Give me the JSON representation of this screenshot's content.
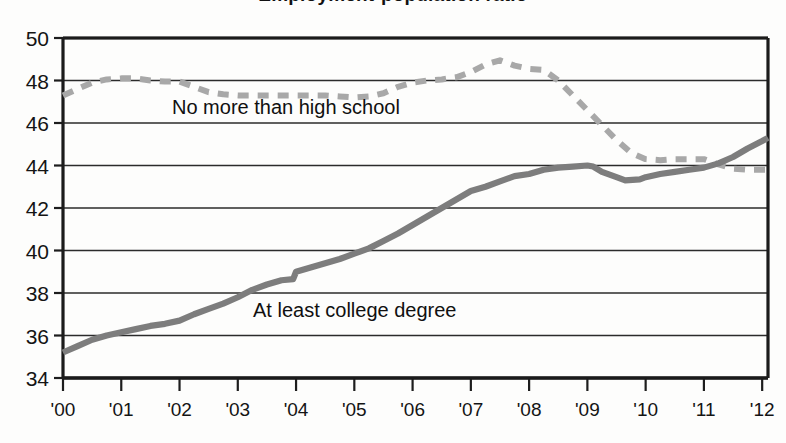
{
  "chart_data": {
    "type": "line",
    "title": "Employment-population ratio",
    "xlabel": "",
    "ylabel": "",
    "ylim": [
      34,
      50
    ],
    "ytick_labels": [
      "34",
      "36",
      "38",
      "40",
      "42",
      "44",
      "46",
      "48",
      "50"
    ],
    "ytick_values": [
      34,
      36,
      38,
      40,
      42,
      44,
      46,
      48,
      50
    ],
    "xtick_labels": [
      "'00",
      "'01",
      "'02",
      "'03",
      "'04",
      "'05",
      "'06",
      "'07",
      "'08",
      "'09",
      "'10",
      "'11",
      "'12"
    ],
    "xtick_values": [
      2000,
      2001,
      2002,
      2003,
      2004,
      2005,
      2006,
      2007,
      2008,
      2009,
      2010,
      2011,
      2012
    ],
    "xlim": [
      2000,
      2012.1
    ],
    "grid": true,
    "legend_position": "inline-annotations",
    "series": [
      {
        "name": "No more than high school",
        "style": "dashed",
        "color": "#a8a8a8",
        "x": [
          2000.0,
          2000.25,
          2000.5,
          2000.75,
          2001.0,
          2001.25,
          2001.5,
          2001.75,
          2002.0,
          2002.25,
          2002.5,
          2002.75,
          2003.0,
          2003.25,
          2003.5,
          2003.75,
          2004.0,
          2004.25,
          2004.5,
          2004.75,
          2005.0,
          2005.25,
          2005.5,
          2005.75,
          2006.0,
          2006.25,
          2006.5,
          2006.75,
          2007.0,
          2007.25,
          2007.5,
          2007.75,
          2008.0,
          2008.25,
          2008.5,
          2008.75,
          2009.0,
          2009.25,
          2009.5,
          2009.75,
          2010.0,
          2010.25,
          2010.5,
          2010.75,
          2011.0,
          2011.25,
          2011.5,
          2011.75,
          2012.0,
          2012.1
        ],
        "values": [
          47.3,
          47.6,
          47.9,
          48.05,
          48.1,
          48.1,
          48.0,
          47.95,
          47.95,
          47.7,
          47.45,
          47.35,
          47.3,
          47.3,
          47.3,
          47.3,
          47.3,
          47.3,
          47.3,
          47.25,
          47.2,
          47.25,
          47.4,
          47.7,
          47.9,
          48.0,
          48.05,
          48.15,
          48.4,
          48.75,
          48.95,
          48.7,
          48.55,
          48.5,
          48.0,
          47.3,
          46.6,
          45.9,
          45.2,
          44.6,
          44.3,
          44.25,
          44.3,
          44.3,
          44.3,
          44.05,
          43.85,
          43.8,
          43.8,
          43.8
        ]
      },
      {
        "name": "At least college degree",
        "style": "solid",
        "color": "#7d7d7d",
        "x": [
          2000.0,
          2000.25,
          2000.5,
          2000.75,
          2001.0,
          2001.25,
          2001.5,
          2001.75,
          2002.0,
          2002.25,
          2002.5,
          2002.75,
          2003.0,
          2003.25,
          2003.5,
          2003.75,
          2003.95,
          2004.0,
          2004.25,
          2004.5,
          2004.75,
          2005.0,
          2005.25,
          2005.5,
          2005.75,
          2006.0,
          2006.25,
          2006.5,
          2006.75,
          2007.0,
          2007.25,
          2007.5,
          2007.75,
          2008.0,
          2008.25,
          2008.5,
          2008.75,
          2009.0,
          2009.1,
          2009.25,
          2009.5,
          2009.65,
          2009.9,
          2010.0,
          2010.25,
          2010.5,
          2010.75,
          2011.0,
          2011.25,
          2011.5,
          2011.75,
          2012.0,
          2012.1
        ],
        "values": [
          35.2,
          35.5,
          35.8,
          36.0,
          36.15,
          36.3,
          36.45,
          36.55,
          36.7,
          37.0,
          37.25,
          37.5,
          37.8,
          38.15,
          38.4,
          38.6,
          38.65,
          39.0,
          39.2,
          39.4,
          39.6,
          39.85,
          40.1,
          40.45,
          40.8,
          41.2,
          41.6,
          42.0,
          42.4,
          42.8,
          43.0,
          43.25,
          43.5,
          43.6,
          43.8,
          43.9,
          43.95,
          44.0,
          43.95,
          43.7,
          43.45,
          43.3,
          43.35,
          43.45,
          43.6,
          43.7,
          43.8,
          43.9,
          44.1,
          44.4,
          44.8,
          45.15,
          45.3
        ]
      }
    ],
    "annotations": [
      {
        "text": "No more than high school",
        "x": 2002.0,
        "y": 46.5
      },
      {
        "text": "At least college degree",
        "x": 2003.5,
        "y": 36.9
      }
    ]
  },
  "axes": {
    "plot_left_px": 63,
    "plot_right_px": 768,
    "plot_top_px": 38,
    "plot_bottom_px": 378
  }
}
